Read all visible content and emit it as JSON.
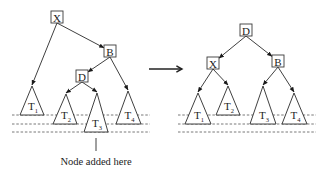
{
  "diagram": {
    "type": "tree-rotation",
    "colors": {
      "stroke": "#2a2a2a",
      "background": "#ffffff",
      "text": "#222222"
    },
    "transition_arrow": {
      "x1": 149,
      "y1": 69,
      "x2": 182,
      "y2": 69
    },
    "caption": {
      "text": "Node added here",
      "x": 96,
      "y": 165,
      "pointer": {
        "x": 96,
        "y1": 138,
        "y2": 151
      }
    },
    "before": {
      "nodes": [
        {
          "id": "X",
          "label": "X",
          "x": 57,
          "y": 17
        },
        {
          "id": "B",
          "label": "B",
          "x": 110,
          "y": 51
        },
        {
          "id": "D",
          "label": "D",
          "x": 82,
          "y": 76
        }
      ],
      "subtrees": [
        {
          "id": "T1",
          "label": "T",
          "sub": "1",
          "apex": [
            32,
            86
          ],
          "base_y": 115,
          "left": 20,
          "right": 44
        },
        {
          "id": "T2",
          "label": "T",
          "sub": "2",
          "apex": [
            66,
            94
          ],
          "base_y": 124,
          "left": 53,
          "right": 77
        },
        {
          "id": "T3",
          "label": "T",
          "sub": "3",
          "apex": [
            97,
            93
          ],
          "base_y": 132,
          "left": 84,
          "right": 108
        },
        {
          "id": "T4",
          "label": "T",
          "sub": "4",
          "apex": [
            128,
            91
          ],
          "base_y": 124,
          "left": 116,
          "right": 141
        }
      ],
      "edges": [
        {
          "from": "X",
          "to": "T1"
        },
        {
          "from": "X",
          "to": "B"
        },
        {
          "from": "B",
          "to": "D"
        },
        {
          "from": "B",
          "to": "T4"
        },
        {
          "from": "D",
          "to": "T2"
        },
        {
          "from": "D",
          "to": "T3"
        }
      ],
      "level_lines": {
        "x1": 12,
        "x2": 150,
        "ys": [
          115,
          124,
          132
        ]
      }
    },
    "after": {
      "nodes": [
        {
          "id": "D",
          "label": "D",
          "x": 246,
          "y": 30
        },
        {
          "id": "X",
          "label": "X",
          "x": 213,
          "y": 63
        },
        {
          "id": "B",
          "label": "B",
          "x": 278,
          "y": 61
        }
      ],
      "subtrees": [
        {
          "id": "T1",
          "label": "T",
          "sub": "1",
          "apex": [
            198,
            93
          ],
          "base_y": 124,
          "left": 185,
          "right": 211
        },
        {
          "id": "T2",
          "label": "T",
          "sub": "2",
          "apex": [
            228,
            86
          ],
          "base_y": 115,
          "left": 216,
          "right": 240
        },
        {
          "id": "T3",
          "label": "T",
          "sub": "3",
          "apex": [
            263,
            86
          ],
          "base_y": 124,
          "left": 250,
          "right": 276
        },
        {
          "id": "T4",
          "label": "T",
          "sub": "4",
          "apex": [
            294,
            93
          ],
          "base_y": 124,
          "left": 282,
          "right": 307
        }
      ],
      "edges": [
        {
          "from": "D",
          "to": "X"
        },
        {
          "from": "D",
          "to": "B"
        },
        {
          "from": "X",
          "to": "T1"
        },
        {
          "from": "X",
          "to": "T2"
        },
        {
          "from": "B",
          "to": "T3"
        },
        {
          "from": "B",
          "to": "T4"
        }
      ],
      "level_lines": {
        "x1": 178,
        "x2": 316,
        "ys": [
          115,
          124,
          132
        ]
      }
    }
  }
}
